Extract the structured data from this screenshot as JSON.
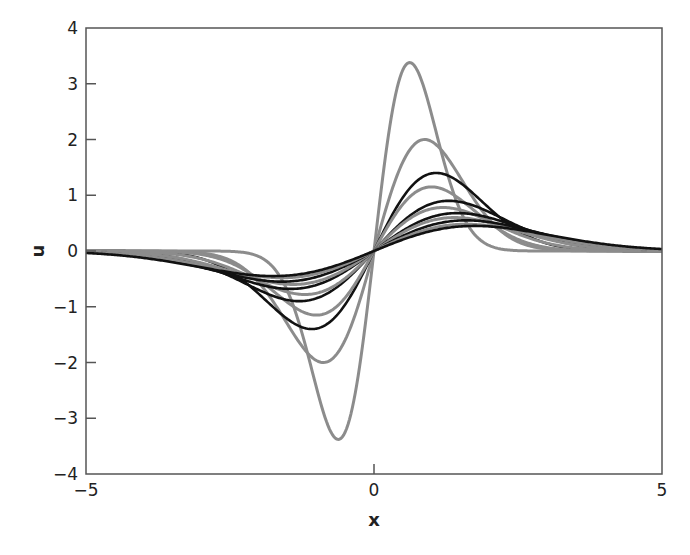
{
  "chart_data": {
    "type": "line",
    "title": "",
    "xlabel": "x",
    "ylabel": "u",
    "xlim": [
      -5,
      5
    ],
    "ylim": [
      -4,
      4
    ],
    "xticks": [
      -5,
      0,
      5
    ],
    "yticks": [
      -4,
      -3,
      -2,
      -1,
      0,
      1,
      2,
      3,
      4
    ],
    "xtick_labels": [
      "−5",
      "0",
      "5"
    ],
    "ytick_labels": [
      "−4",
      "−3",
      "−2",
      "−1",
      "0",
      "1",
      "2",
      "3",
      "4"
    ],
    "grid": false,
    "legend": null,
    "colors": {
      "gray": "#8c8c8c",
      "black": "#111111",
      "axis": "#555555"
    },
    "series": [
      {
        "name": "curve-1",
        "color": "gray",
        "peak_x": 0.62,
        "peak_u": 3.38
      },
      {
        "name": "curve-2",
        "color": "gray",
        "peak_x": 0.88,
        "peak_u": 2.0
      },
      {
        "name": "curve-3",
        "color": "black",
        "peak_x": 1.08,
        "peak_u": 1.4
      },
      {
        "name": "curve-4",
        "color": "gray",
        "peak_x": 1.0,
        "peak_u": 1.15
      },
      {
        "name": "curve-5",
        "color": "black",
        "peak_x": 1.3,
        "peak_u": 0.9
      },
      {
        "name": "curve-6",
        "color": "gray",
        "peak_x": 1.2,
        "peak_u": 0.78
      },
      {
        "name": "curve-7",
        "color": "black",
        "peak_x": 1.45,
        "peak_u": 0.68
      },
      {
        "name": "curve-8",
        "color": "gray",
        "peak_x": 1.4,
        "peak_u": 0.6
      },
      {
        "name": "curve-9",
        "color": "black",
        "peak_x": 1.6,
        "peak_u": 0.55
      },
      {
        "name": "curve-10",
        "color": "gray",
        "peak_x": 1.6,
        "peak_u": 0.48
      },
      {
        "name": "curve-11",
        "color": "black",
        "peak_x": 1.75,
        "peak_u": 0.45
      }
    ]
  },
  "layout": {
    "plot_left": 86,
    "plot_right": 662,
    "plot_top": 28,
    "plot_bottom": 474
  }
}
